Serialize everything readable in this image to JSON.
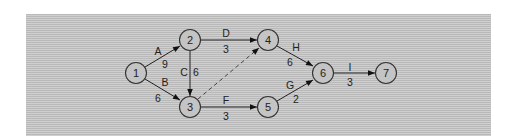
{
  "diagram": {
    "type": "activity-on-arrow network",
    "nodes": [
      {
        "id": "1",
        "label": "1",
        "x": 136,
        "y": 73
      },
      {
        "id": "2",
        "label": "2",
        "x": 190,
        "y": 40
      },
      {
        "id": "3",
        "label": "3",
        "x": 190,
        "y": 107
      },
      {
        "id": "4",
        "label": "4",
        "x": 268,
        "y": 40
      },
      {
        "id": "5",
        "label": "5",
        "x": 268,
        "y": 107
      },
      {
        "id": "6",
        "label": "6",
        "x": 323,
        "y": 73
      },
      {
        "id": "7",
        "label": "7",
        "x": 386,
        "y": 73
      }
    ],
    "edges": [
      {
        "from": "1",
        "to": "2",
        "activity": "A",
        "duration": "9",
        "style": "solid"
      },
      {
        "from": "1",
        "to": "3",
        "activity": "B",
        "duration": "6",
        "style": "solid"
      },
      {
        "from": "2",
        "to": "3",
        "activity": "C",
        "duration": "6",
        "style": "solid"
      },
      {
        "from": "2",
        "to": "4",
        "activity": "D",
        "duration": "3",
        "style": "solid"
      },
      {
        "from": "3",
        "to": "4",
        "activity": "",
        "duration": "",
        "style": "dashed"
      },
      {
        "from": "3",
        "to": "5",
        "activity": "F",
        "duration": "3",
        "style": "solid"
      },
      {
        "from": "4",
        "to": "6",
        "activity": "H",
        "duration": "6",
        "style": "solid"
      },
      {
        "from": "5",
        "to": "6",
        "activity": "G",
        "duration": "2",
        "style": "solid"
      },
      {
        "from": "6",
        "to": "7",
        "activity": "I",
        "duration": "3",
        "style": "solid"
      }
    ]
  }
}
